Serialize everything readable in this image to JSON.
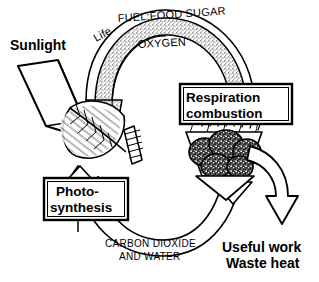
{
  "diagram": {
    "background_color": "#ffffff",
    "ink_color": "#000000",
    "labels": {
      "sunlight": "Sunlight",
      "life": "Life",
      "fuel_food_sugar": "FUEL:FOOD SUGAR",
      "oxygen": "OXYGEN",
      "carbon_dioxide": "CARBON DIOXIDE",
      "and_water": "AND WATER",
      "useful_work": "Useful work",
      "waste_heat": "Waste heat"
    },
    "boxes": [
      {
        "id": "photosynthesis",
        "line1": "Photo-",
        "line2": "synthesis"
      },
      {
        "id": "respiration",
        "line1": "Respiration",
        "line2": "combustion"
      }
    ],
    "illustrations": [
      {
        "id": "leaf",
        "name": "leaf-illustration"
      },
      {
        "id": "coal-fire",
        "name": "burning-coal-illustration"
      }
    ],
    "arrows": [
      {
        "id": "sunlight-ray",
        "name": "sunlight-arrow",
        "direction": "down-right"
      },
      {
        "id": "upper-arc",
        "name": "fuel-oxygen-arc-arrow",
        "direction": "clockwise-right-to-left",
        "fill": "stippled"
      },
      {
        "id": "lower-arc",
        "name": "carbon-dioxide-water-arc-arrow",
        "direction": "counterclockwise-right-to-left",
        "fill": "outline"
      },
      {
        "id": "output-arrow",
        "name": "useful-work-waste-heat-arrow",
        "direction": "down"
      }
    ]
  }
}
